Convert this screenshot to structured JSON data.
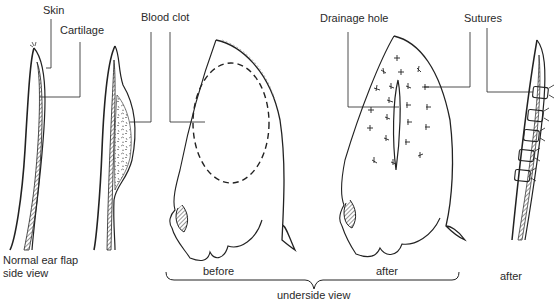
{
  "labels": {
    "skin": "Skin",
    "cartilage": "Cartilage",
    "blood_clot": "Blood clot",
    "drainage_hole": "Drainage hole",
    "sutures": "Sutures",
    "normal_line1": "Normal ear flap",
    "normal_line2": "side view",
    "before": "before",
    "after_underside": "after",
    "after_side": "after",
    "underside_view": "underside view"
  },
  "panels": [
    {
      "id": "normal-side",
      "caption": "Normal ear flap side view"
    },
    {
      "id": "hematoma-side",
      "caption": ""
    },
    {
      "id": "underside-before",
      "caption": "before"
    },
    {
      "id": "underside-after",
      "caption": "after"
    },
    {
      "id": "sutured-side",
      "caption": "after"
    }
  ],
  "group_caption": "underside view",
  "colors": {
    "ink": "#222222",
    "background": "#ffffff"
  }
}
